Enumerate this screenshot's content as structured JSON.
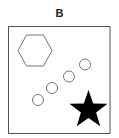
{
  "panel": {
    "label": "B"
  },
  "colors": {
    "frame": "#555555",
    "outline": "#777777",
    "star_fill": "#000000",
    "background": "#ffffff"
  },
  "shapes": {
    "frame": {
      "x": 8.5,
      "y": 26.5,
      "width": 101.5,
      "height": 107
    },
    "hexagon": {
      "cx": 35,
      "cy": 50.5,
      "rx": 17,
      "ry": 15.5,
      "fill": "none"
    },
    "circles": [
      {
        "cx": 38,
        "cy": 100,
        "r": 5.5
      },
      {
        "cx": 52,
        "cy": 88,
        "r": 5.5
      },
      {
        "cx": 69,
        "cy": 76.5,
        "r": 5.5
      },
      {
        "cx": 85,
        "cy": 64.5,
        "r": 5.5
      }
    ],
    "star": {
      "cx": 88.5,
      "cy": 110,
      "outer_r": 20,
      "inner_r": 8,
      "fill": "#000000"
    }
  }
}
